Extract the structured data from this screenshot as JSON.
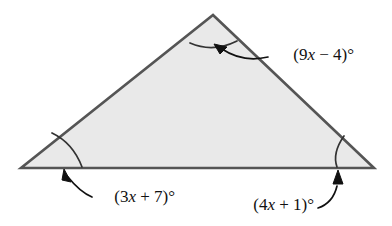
{
  "figure": {
    "shape": "triangle",
    "background_color": "#ffffff",
    "fill_color": "#e9e9e9",
    "stroke_color": "#555555",
    "label_color": "#111111",
    "vertices": [
      {
        "name": "apex",
        "x": 213,
        "y": 15
      },
      {
        "name": "bottom-left",
        "x": 21,
        "y": 168
      },
      {
        "name": "bottom-right",
        "x": 374,
        "y": 168
      }
    ],
    "angles": [
      {
        "id": "apex-angle",
        "vertex": "apex",
        "expression": "(9x − 4)°",
        "coefficient": 9,
        "variable": "x",
        "operator": "−",
        "constant": 4,
        "label_prefix": "(9",
        "label_var": "x",
        "label_suffix": " − 4)°",
        "label_x": 272,
        "label_y": 60
      },
      {
        "id": "bottom-left-angle",
        "vertex": "bottom-left",
        "expression": "(3x + 7)°",
        "coefficient": 3,
        "variable": "x",
        "operator": "+",
        "constant": 7,
        "label_prefix": "(3",
        "label_var": "x",
        "label_suffix": " + 7)°",
        "label_x": 93,
        "label_y": 202
      },
      {
        "id": "bottom-right-angle",
        "vertex": "bottom-right",
        "expression": "(4x + 1)°",
        "coefficient": 4,
        "variable": "x",
        "operator": "+",
        "constant": 1,
        "label_prefix": "(4",
        "label_var": "x",
        "label_suffix": " + 1)°",
        "label_x": 232,
        "label_y": 210
      }
    ]
  }
}
